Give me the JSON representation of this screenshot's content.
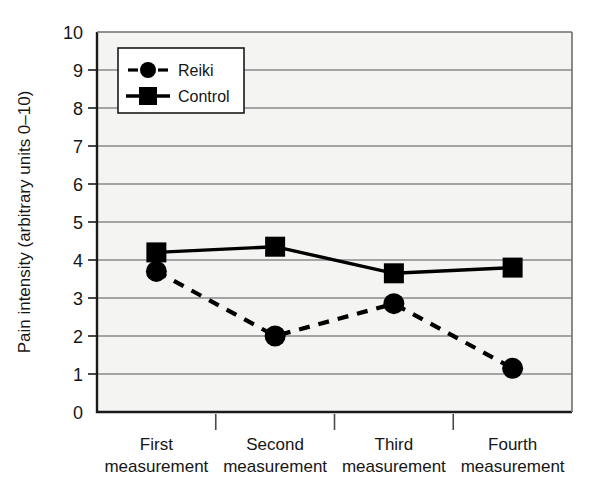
{
  "chart_data": {
    "type": "line",
    "title": "",
    "xlabel": "",
    "ylabel": "Pain intensity (arbitrary units 0–10)",
    "categories": [
      "First measurement",
      "Second measurement",
      "Third measurement",
      "Fourth measurement"
    ],
    "category_lines": [
      [
        "First",
        "measurement"
      ],
      [
        "Second",
        "measurement"
      ],
      [
        "Third",
        "measurement"
      ],
      [
        "Fourth",
        "measurement"
      ]
    ],
    "ylim": [
      0,
      10
    ],
    "ytick_step": 1,
    "yticks": [
      "10",
      "9",
      "8",
      "7",
      "6",
      "5",
      "4",
      "3",
      "2",
      "1",
      "0"
    ],
    "grid": true,
    "grid_axis": "y",
    "legend_position": "top-left-inside",
    "series": [
      {
        "name": "Reiki",
        "values": [
          3.7,
          2.0,
          2.85,
          1.15
        ],
        "marker": "circle",
        "linestyle": "dashed",
        "color": "#000000"
      },
      {
        "name": "Control",
        "values": [
          4.2,
          4.35,
          3.65,
          3.8
        ],
        "marker": "square",
        "linestyle": "solid",
        "color": "#000000"
      }
    ],
    "colors": {
      "plot_background": "#f4f4f2",
      "grid": "#8a8a8a",
      "axis": "#1a1a1a",
      "series": "#000000",
      "legend_background": "#ffffff",
      "legend_border": "#1a1a1a"
    }
  }
}
